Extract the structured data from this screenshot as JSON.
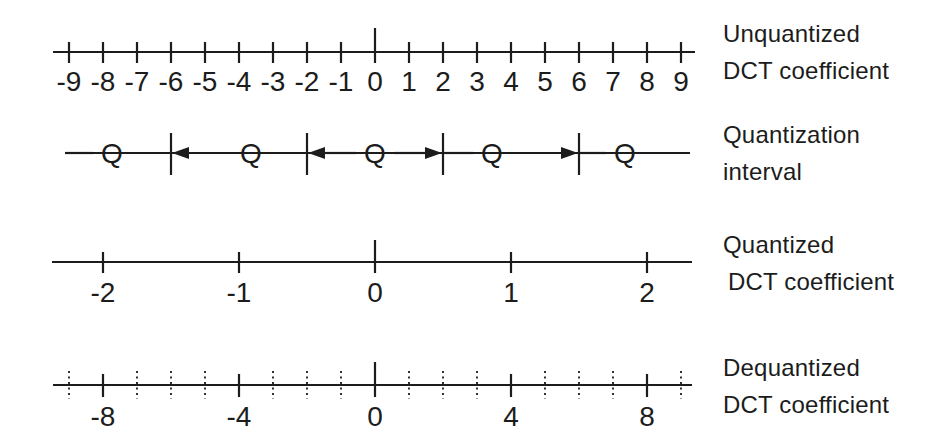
{
  "colors": {
    "ink": "#1c1c1c",
    "background": "#ffffff"
  },
  "rows": [
    {
      "id": "unquantized",
      "kind": "axis",
      "side_label_lines": [
        "Unquantized",
        "DCT coefficient"
      ],
      "ticks": [
        {
          "position": -9,
          "label": "-9"
        },
        {
          "position": -8,
          "label": "-8"
        },
        {
          "position": -7,
          "label": "-7"
        },
        {
          "position": -6,
          "label": "-6"
        },
        {
          "position": -5,
          "label": "-5"
        },
        {
          "position": -4,
          "label": "-4"
        },
        {
          "position": -3,
          "label": "-3"
        },
        {
          "position": -2,
          "label": "-2"
        },
        {
          "position": -1,
          "label": "-1"
        },
        {
          "position": 0,
          "label": "0"
        },
        {
          "position": 1,
          "label": "1"
        },
        {
          "position": 2,
          "label": "2"
        },
        {
          "position": 3,
          "label": "3"
        },
        {
          "position": 4,
          "label": "4"
        },
        {
          "position": 5,
          "label": "5"
        },
        {
          "position": 6,
          "label": "6"
        },
        {
          "position": 7,
          "label": "7"
        },
        {
          "position": 8,
          "label": "8"
        },
        {
          "position": 9,
          "label": "9"
        }
      ]
    },
    {
      "id": "quantization-interval",
      "kind": "intervals",
      "side_label_lines": [
        "Quantization",
        "interval"
      ],
      "boundary_positions": [
        -6,
        -2,
        2,
        6
      ],
      "segments": [
        {
          "label": "Q",
          "arrows": []
        },
        {
          "label": "Q",
          "arrows": [
            "left"
          ]
        },
        {
          "label": "Q",
          "arrows": [
            "left",
            "right"
          ]
        },
        {
          "label": "Q",
          "arrows": [
            "right"
          ]
        },
        {
          "label": "Q",
          "arrows": []
        }
      ]
    },
    {
      "id": "quantized",
      "kind": "axis",
      "side_label_lines": [
        "Quantized",
        "DCT coefficient"
      ],
      "ticks": [
        {
          "position": -8,
          "label": "-2"
        },
        {
          "position": -4,
          "label": "-1"
        },
        {
          "position": 0,
          "label": "0"
        },
        {
          "position": 4,
          "label": "1"
        },
        {
          "position": 8,
          "label": "2"
        }
      ]
    },
    {
      "id": "dequantized",
      "kind": "axis",
      "side_label_lines": [
        "Dequantized",
        "DCT coefficient"
      ],
      "ticks": [
        {
          "position": -8,
          "label": "-8"
        },
        {
          "position": -4,
          "label": "-4"
        },
        {
          "position": 0,
          "label": "0"
        },
        {
          "position": 4,
          "label": "4"
        },
        {
          "position": 8,
          "label": "8"
        }
      ],
      "dotted_tick_positions": [
        -9,
        -7,
        -6,
        -5,
        -3,
        -2,
        -1,
        1,
        2,
        3,
        5,
        6,
        7,
        9
      ]
    }
  ]
}
